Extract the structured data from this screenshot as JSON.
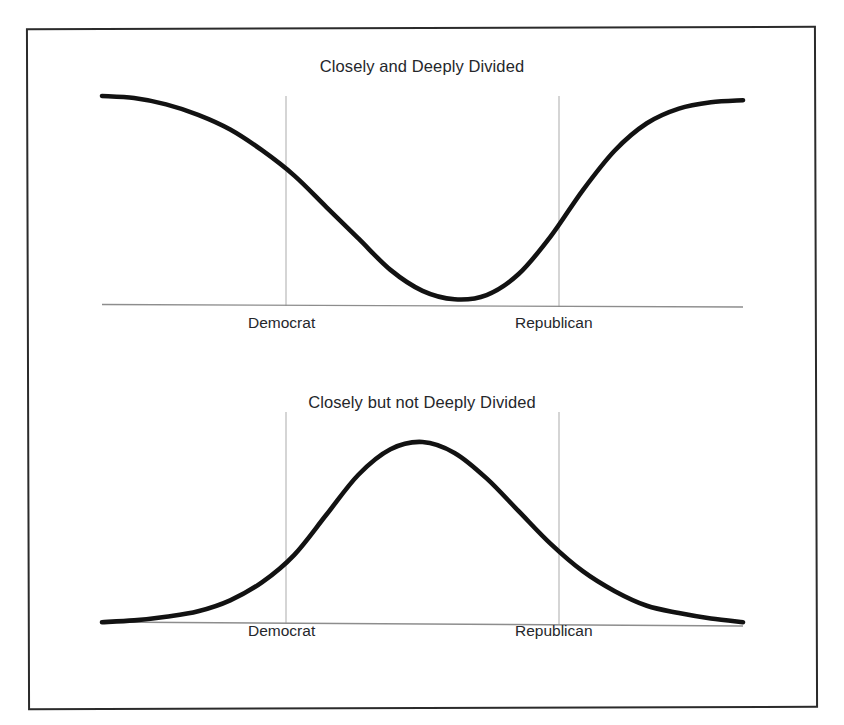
{
  "figure": {
    "background_color": "#ffffff",
    "frame_color": "#2b2b2b",
    "curve_color": "#121212",
    "axis_color": "#8d8d8d",
    "gridline_color": "#b3b3b3",
    "text_color": "#25272b"
  },
  "charts": [
    {
      "id": "closely-and-deeply-divided",
      "title": "Closely and Deeply Divided",
      "tick_labels": {
        "left": "Democrat",
        "right": "Republican"
      }
    },
    {
      "id": "closely-but-not-deeply-divided",
      "title": "Closely but not Deeply Divided",
      "tick_labels": {
        "left": "Democrat",
        "right": "Republican"
      }
    }
  ],
  "chart_data": [
    {
      "type": "line",
      "id": "closely-and-deeply-divided",
      "title": "Closely and Deeply Divided",
      "subtitle": "",
      "xlabel": "",
      "ylabel": "",
      "grid": true,
      "gridlines_x": [
        "Democrat",
        "Republican"
      ],
      "legend": "none",
      "description": "Bimodal (U-shaped) distribution of political opinion: mass concentrated at the Democrat and Republican poles with a deep trough at the center, illustrating a deeply divided electorate.",
      "xlim": [
        0,
        100
      ],
      "ylim": [
        0,
        100
      ],
      "x_tick_positions": [
        30,
        66
      ],
      "x_tick_labels": [
        "Democrat",
        "Republican"
      ],
      "series": [
        {
          "name": "Opinion density (deeply divided)",
          "x": [
            0,
            5,
            10,
            15,
            20,
            25,
            30,
            35,
            40,
            45,
            50,
            55,
            60,
            65,
            70,
            75,
            80,
            85,
            90,
            95,
            100
          ],
          "y": [
            100,
            99,
            96,
            91,
            84,
            74,
            62,
            47,
            32,
            17,
            7,
            3,
            5,
            15,
            33,
            55,
            74,
            87,
            94,
            97,
            98
          ]
        }
      ]
    },
    {
      "type": "line",
      "id": "closely-but-not-deeply-divided",
      "title": "Closely but not Deeply Divided",
      "subtitle": "",
      "xlabel": "",
      "ylabel": "",
      "grid": true,
      "gridlines_x": [
        "Democrat",
        "Republican"
      ],
      "legend": "none",
      "description": "Unimodal (bell-shaped) distribution of political opinion: mass concentrated in the moderate center between the Democrat and Republican markers, illustrating an electorate that is closely but not deeply divided.",
      "xlim": [
        0,
        100
      ],
      "ylim": [
        0,
        100
      ],
      "x_tick_positions": [
        30,
        66
      ],
      "x_tick_labels": [
        "Democrat",
        "Republican"
      ],
      "series": [
        {
          "name": "Opinion density (not deeply divided)",
          "x": [
            0,
            5,
            10,
            15,
            20,
            25,
            30,
            35,
            40,
            45,
            50,
            55,
            60,
            65,
            70,
            75,
            80,
            85,
            90,
            95,
            100
          ],
          "y": [
            1,
            2,
            4,
            7,
            13,
            23,
            38,
            60,
            82,
            96,
            100,
            94,
            80,
            62,
            44,
            29,
            18,
            10,
            6,
            3,
            1
          ]
        }
      ]
    }
  ]
}
